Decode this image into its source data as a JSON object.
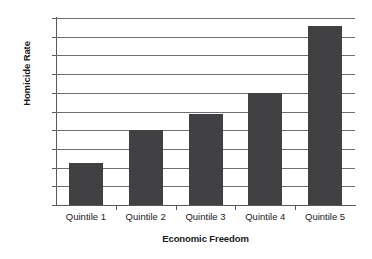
{
  "chart_data": {
    "type": "bar",
    "title": "",
    "xlabel": "Economic Freedom",
    "ylabel": "Homicide Rate",
    "categories": [
      "Quintile 1",
      "Quintile 2",
      "Quintile 3",
      "Quintile 4",
      "Quintile 5"
    ],
    "values": [
      4.5,
      8.0,
      9.7,
      12.0,
      19.1
    ],
    "ylim": [
      0,
      20
    ],
    "ytick_labels": [
      "0",
      "2",
      "4",
      "6",
      "8",
      "10",
      "12",
      "14",
      "16",
      "18",
      "20"
    ],
    "ytick_values": [
      0,
      2,
      4,
      6,
      8,
      10,
      12,
      14,
      16,
      18,
      20
    ],
    "grid": true,
    "legend": false,
    "bar_color": "#414042",
    "gridline_color": "#6e6e70",
    "axis_color": "#58585a",
    "background_color": "#ffffff"
  }
}
